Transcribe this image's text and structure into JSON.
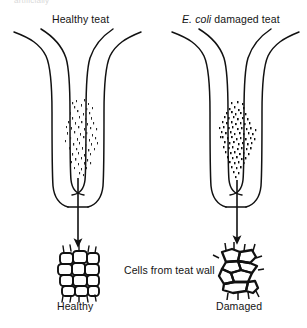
{
  "figure": {
    "background_color": "#ffffff",
    "ink_color": "#111111",
    "truncated_top_text": "artificially",
    "labels": {
      "healthy_teat": "Healthy teat",
      "ecoli_species": "E. coli",
      "ecoli_damaged_teat_rest": " damaged teat",
      "cells_caption": "Cells from teat wall",
      "healthy_cells": "Healthy",
      "damaged_cells": "Damaged"
    },
    "panels": [
      {
        "id": "healthy",
        "title": "Healthy teat",
        "cells_label": "Healthy",
        "keratin_density": "sparse",
        "keratin_speck_count": 150,
        "cell_pattern": "regular-grid",
        "cell_rows": 5,
        "cell_columns": 4
      },
      {
        "id": "damaged",
        "title": "E. coli damaged teat",
        "cells_label": "Damaged",
        "keratin_density": "dense",
        "keratin_speck_count": 420,
        "cell_pattern": "irregular",
        "cell_rows": 5,
        "cell_columns": 4
      }
    ],
    "arrows": {
      "count": 2,
      "direction": "down",
      "meaning": "cells sampled from teat wall"
    }
  }
}
